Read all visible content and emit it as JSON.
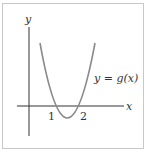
{
  "diagram": {
    "title": "",
    "axes": {
      "x_label": "x",
      "y_label": "y"
    },
    "curve": {
      "label": "y = g(x)",
      "type": "parabola",
      "roots": [
        1,
        2
      ]
    },
    "ticks": [
      {
        "label": "1",
        "x": 1
      },
      {
        "label": "2",
        "x": 2
      }
    ],
    "colors": {
      "curve": "#888888",
      "axes": "#333333",
      "frame": "#c8c8c8"
    }
  }
}
